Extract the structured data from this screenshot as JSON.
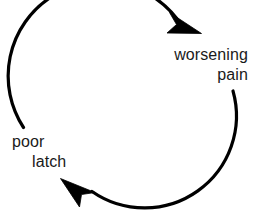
{
  "diagram": {
    "type": "cycle",
    "direction": "clockwise",
    "background_color": "#ffffff",
    "stroke_color": "#000000",
    "text_color": "#1a1a1a",
    "nodes": [
      {
        "id": "worsening-pain",
        "lines": [
          "worsening",
          "pain"
        ],
        "position": "right",
        "align": "right"
      },
      {
        "id": "poor-latch",
        "lines": [
          "poor",
          "latch"
        ],
        "position": "left",
        "align": "left"
      }
    ],
    "arrows": [
      {
        "id": "arrow-to-worsening-pain",
        "from": "poor-latch",
        "to": "worsening-pain",
        "path": "top",
        "head": "arrowhead-right"
      },
      {
        "id": "arrow-to-poor-latch",
        "from": "worsening-pain",
        "to": "poor-latch",
        "path": "bottom",
        "head": "arrowhead-left"
      }
    ]
  }
}
